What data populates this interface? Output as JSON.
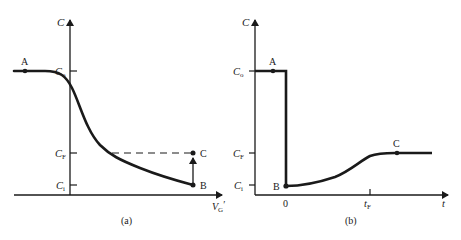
{
  "figure": {
    "panel_a": {
      "caption": "(a)",
      "y_axis_label": "C",
      "x_axis_label": "V",
      "x_axis_label_sub": "G",
      "x_axis_label_prime": "′",
      "ticks": {
        "c0": {
          "main": "C",
          "sub": "o"
        },
        "cf": {
          "main": "C",
          "sub": "F"
        },
        "ci": {
          "main": "C",
          "sub": "i"
        }
      },
      "points": {
        "A": "A",
        "B": "B",
        "C": "C"
      }
    },
    "panel_b": {
      "caption": "(b)",
      "y_axis_label": "C",
      "x_axis_label": "t",
      "ticks": {
        "c0": {
          "main": "C",
          "sub": "o"
        },
        "cf": {
          "main": "C",
          "sub": "F"
        },
        "ci": {
          "main": "C",
          "sub": "i"
        },
        "zero": "0",
        "tf": {
          "main": "t",
          "sub": "F"
        }
      },
      "points": {
        "A": "A",
        "B": "B",
        "C": "C"
      }
    },
    "colors": {
      "ink": "#1a1a1a",
      "background": "#ffffff"
    }
  }
}
